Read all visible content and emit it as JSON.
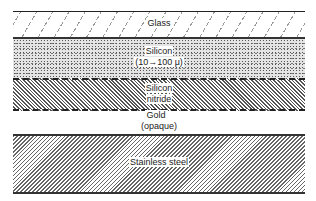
{
  "diagram": {
    "type": "cross-section layer stack",
    "layers": [
      {
        "name": "glass",
        "label": "Glass",
        "pattern": "sparse diagonal dashes"
      },
      {
        "name": "silicon",
        "label_line1": "Silicon",
        "label_line2": "(10→100 μ)",
        "pattern": "stipple"
      },
      {
        "name": "silicon-nitride",
        "label_line1": "Silicon",
        "label_line2": "nitride",
        "pattern": "dense hatch"
      },
      {
        "name": "gold",
        "label_line1": "Gold",
        "label_line2": "(opaque)",
        "pattern": "none"
      },
      {
        "name": "stainless-steel",
        "label": "Stainless steel",
        "pattern": "diagonal hatch"
      }
    ]
  }
}
